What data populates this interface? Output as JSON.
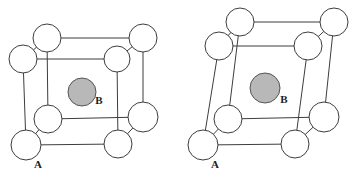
{
  "figure": {
    "name": "unit-cell-pair-diagram",
    "background_color": "#ffffff",
    "width": 354,
    "height": 175,
    "line_color": "#3d3d3d",
    "atom_a_fill": "#ffffff",
    "atom_b_fill": "#b8b8b8"
  },
  "cells": [
    {
      "id": "cubic-cell",
      "caption": "",
      "corner_label": "A",
      "center_label": "B",
      "corner_label_pos": {
        "x": 38,
        "y": 168
      },
      "center_label_pos": {
        "x": 99,
        "y": 104
      },
      "center_atom": {
        "cx": 82,
        "cy": 92,
        "r": 14
      },
      "corner_atoms": [
        {
          "name": "back-top-left",
          "cx": 47,
          "cy": 38,
          "r": 14
        },
        {
          "name": "back-top-right",
          "cx": 143,
          "cy": 38,
          "r": 14
        },
        {
          "name": "back-bottom-left",
          "cx": 48,
          "cy": 119,
          "r": 14
        },
        {
          "name": "back-bottom-right",
          "cx": 143,
          "cy": 117,
          "r": 15
        },
        {
          "name": "front-top-left",
          "cx": 23,
          "cy": 59,
          "r": 14
        },
        {
          "name": "front-top-right",
          "cx": 117,
          "cy": 59,
          "r": 13
        },
        {
          "name": "front-bottom-left",
          "cx": 26,
          "cy": 145,
          "r": 15
        },
        {
          "name": "front-bottom-right",
          "cx": 118,
          "cy": 144,
          "r": 14
        }
      ],
      "edges": [
        [
          47,
          38,
          143,
          38
        ],
        [
          47,
          38,
          48,
          119
        ],
        [
          143,
          38,
          143,
          117
        ],
        [
          48,
          119,
          143,
          117
        ],
        [
          23,
          59,
          117,
          59
        ],
        [
          23,
          59,
          26,
          145
        ],
        [
          117,
          59,
          118,
          144
        ],
        [
          26,
          145,
          118,
          144
        ],
        [
          47,
          38,
          23,
          59
        ],
        [
          143,
          38,
          117,
          59
        ],
        [
          48,
          119,
          26,
          145
        ],
        [
          143,
          117,
          118,
          144
        ]
      ]
    },
    {
      "id": "distorted-cell",
      "caption": "",
      "corner_label": "A",
      "center_label": "B",
      "corner_label_pos": {
        "x": 215,
        "y": 168
      },
      "center_label_pos": {
        "x": 284,
        "y": 103
      },
      "center_atom": {
        "cx": 265,
        "cy": 88,
        "r": 15
      },
      "corner_atoms": [
        {
          "name": "back-top-left",
          "cx": 240,
          "cy": 22,
          "r": 14
        },
        {
          "name": "back-top-right",
          "cx": 334,
          "cy": 22,
          "r": 14
        },
        {
          "name": "back-bottom-left",
          "cx": 228,
          "cy": 119,
          "r": 14
        },
        {
          "name": "back-bottom-right",
          "cx": 324,
          "cy": 117,
          "r": 15
        },
        {
          "name": "front-top-left",
          "cx": 219,
          "cy": 46,
          "r": 14
        },
        {
          "name": "front-top-right",
          "cx": 308,
          "cy": 46,
          "r": 14
        },
        {
          "name": "front-bottom-left",
          "cx": 203,
          "cy": 145,
          "r": 15
        },
        {
          "name": "front-bottom-right",
          "cx": 295,
          "cy": 144,
          "r": 14
        }
      ],
      "edges": [
        [
          240,
          22,
          334,
          22
        ],
        [
          240,
          22,
          228,
          119
        ],
        [
          334,
          22,
          324,
          117
        ],
        [
          228,
          119,
          324,
          117
        ],
        [
          219,
          46,
          308,
          46
        ],
        [
          219,
          46,
          203,
          145
        ],
        [
          308,
          46,
          295,
          144
        ],
        [
          203,
          145,
          295,
          144
        ],
        [
          240,
          22,
          219,
          46
        ],
        [
          334,
          22,
          308,
          46
        ],
        [
          228,
          119,
          203,
          145
        ],
        [
          324,
          117,
          295,
          144
        ]
      ]
    }
  ]
}
